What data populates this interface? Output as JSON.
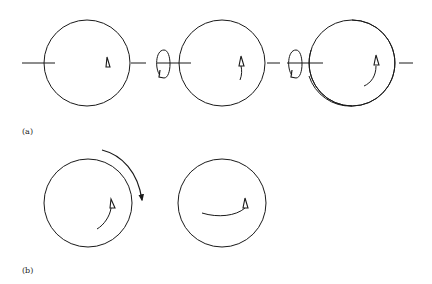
{
  "figure": {
    "panels": [
      {
        "label": "(a)",
        "description": "Three spheres on a common horizontal axis with rotation symbols between them; a marker triangle moves along a curved path",
        "spheres": [
          {
            "cx": 87,
            "cy": 63,
            "r": 43,
            "marker": "triangle",
            "trail": "none"
          },
          {
            "cx": 222,
            "cy": 63,
            "r": 43,
            "marker": "triangle",
            "trail": "short-arc"
          },
          {
            "cx": 352,
            "cy": 63,
            "r": 43,
            "marker": "triangle",
            "trail": "long-arc"
          }
        ],
        "rotation_symbols": [
          {
            "cx": 165,
            "cy": 67
          },
          {
            "cx": 296,
            "cy": 67
          }
        ]
      },
      {
        "label": "(b)",
        "description": "Sphere with marker trail and external curved rotation arrow, and a second sphere with a horizontal trail",
        "spheres": [
          {
            "cx": 88,
            "cy": 203,
            "r": 44,
            "marker": "triangle",
            "trail": "arc-up"
          },
          {
            "cx": 222,
            "cy": 203,
            "r": 44,
            "marker": "triangle",
            "trail": "horizontal-arc"
          }
        ],
        "external_arrow": {
          "from": [
            102,
            149
          ],
          "to": [
            143,
            203
          ],
          "direction": "clockwise"
        }
      }
    ],
    "stroke_color": "#1a1a1a",
    "background": "#ffffff"
  }
}
